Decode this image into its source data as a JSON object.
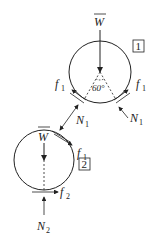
{
  "diagram": {
    "type": "free-body-diagram",
    "circle1": {
      "box_label": "1",
      "weight": {
        "symbol": "W",
        "overbar": true
      },
      "angle_label": "60°",
      "friction_left": {
        "symbol": "f",
        "sub": "1"
      },
      "friction_right": {
        "symbol": "f",
        "sub": "1"
      },
      "normal_left": {
        "symbol": "N",
        "sub": "1"
      },
      "normal_right": {
        "symbol": "N",
        "sub": "1"
      }
    },
    "circle2": {
      "box_label": "2",
      "weight": {
        "symbol": "W",
        "overbar": true
      },
      "contact_normal": {
        "symbol": "N",
        "sub": "1"
      },
      "contact_friction": {
        "symbol": "f",
        "sub": "1"
      },
      "ground_friction": {
        "symbol": "f",
        "sub": "2"
      },
      "ground_normal": {
        "symbol": "N",
        "sub": "2"
      }
    }
  }
}
